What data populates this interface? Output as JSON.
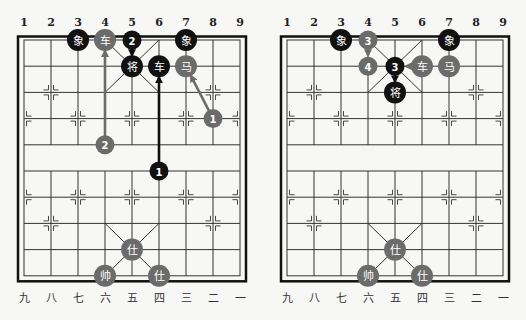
{
  "colors": {
    "background": "#f7f7f5",
    "grid": "#333333",
    "border": "#111111",
    "red_side": "#6b6b6b",
    "black_side": "#111111",
    "piece_text": "#ffffff"
  },
  "top_file_numbers": [
    "1",
    "2",
    "3",
    "4",
    "5",
    "6",
    "7",
    "8",
    "9"
  ],
  "bottom_file_labels": [
    "九",
    "八",
    "七",
    "六",
    "五",
    "四",
    "三",
    "二",
    "一"
  ],
  "boards": [
    {
      "name": "board-left",
      "origin_x": 24,
      "origin_y": 40,
      "col_step": 27,
      "row_step": 26.2,
      "pieces": [
        {
          "label": "象",
          "side": "black",
          "col": 2,
          "row": 0
        },
        {
          "label": "车",
          "side": "red",
          "col": 3,
          "row": 0
        },
        {
          "label": "象",
          "side": "black",
          "col": 6,
          "row": 0
        },
        {
          "label": "将",
          "side": "black",
          "col": 4,
          "row": 1
        },
        {
          "label": "车",
          "side": "black",
          "col": 5,
          "row": 1
        },
        {
          "label": "马",
          "side": "red",
          "col": 6,
          "row": 1
        },
        {
          "label": "仕",
          "side": "red",
          "col": 4,
          "row": 8
        },
        {
          "label": "帅",
          "side": "red",
          "col": 3,
          "row": 9
        },
        {
          "label": "仕",
          "side": "red",
          "col": 5,
          "row": 9
        }
      ],
      "markers": [
        {
          "label": "2",
          "side": "black",
          "col": 4,
          "row": 0
        },
        {
          "label": "1",
          "side": "red",
          "col": 7,
          "row": 3
        },
        {
          "label": "2",
          "side": "red",
          "col": 3,
          "row": 4
        },
        {
          "label": "1",
          "side": "black",
          "col": 5,
          "row": 5
        }
      ],
      "arrows": [
        {
          "side": "red",
          "from": [
            3,
            4
          ],
          "to": [
            3,
            0
          ]
        },
        {
          "side": "black",
          "from": [
            5,
            5
          ],
          "to": [
            5,
            1
          ]
        },
        {
          "side": "red",
          "from": [
            7,
            3
          ],
          "to": [
            6,
            1
          ]
        },
        {
          "side": "black",
          "from": [
            4,
            0
          ],
          "to": [
            4,
            1
          ]
        }
      ]
    },
    {
      "name": "board-right",
      "origin_x": 287,
      "origin_y": 40,
      "col_step": 27,
      "row_step": 26.2,
      "pieces": [
        {
          "label": "象",
          "side": "black",
          "col": 2,
          "row": 0
        },
        {
          "label": "象",
          "side": "black",
          "col": 6,
          "row": 0
        },
        {
          "label": "车",
          "side": "red",
          "col": 5,
          "row": 1
        },
        {
          "label": "马",
          "side": "red",
          "col": 6,
          "row": 1
        },
        {
          "label": "将",
          "side": "black",
          "col": 4,
          "row": 2
        },
        {
          "label": "仕",
          "side": "red",
          "col": 4,
          "row": 8
        },
        {
          "label": "帅",
          "side": "red",
          "col": 3,
          "row": 9
        },
        {
          "label": "仕",
          "side": "red",
          "col": 5,
          "row": 9
        }
      ],
      "markers": [
        {
          "label": "3",
          "side": "red",
          "col": 3,
          "row": 0
        },
        {
          "label": "4",
          "side": "red",
          "col": 3,
          "row": 1
        },
        {
          "label": "3",
          "side": "black",
          "col": 4,
          "row": 1
        }
      ],
      "arrows": [
        {
          "side": "red",
          "from": [
            3,
            0
          ],
          "to": [
            3,
            1
          ]
        },
        {
          "side": "black",
          "from": [
            4,
            1
          ],
          "to": [
            4,
            2
          ]
        },
        {
          "side": "red",
          "from": [
            5,
            1
          ],
          "to": [
            4,
            1
          ]
        }
      ]
    }
  ]
}
